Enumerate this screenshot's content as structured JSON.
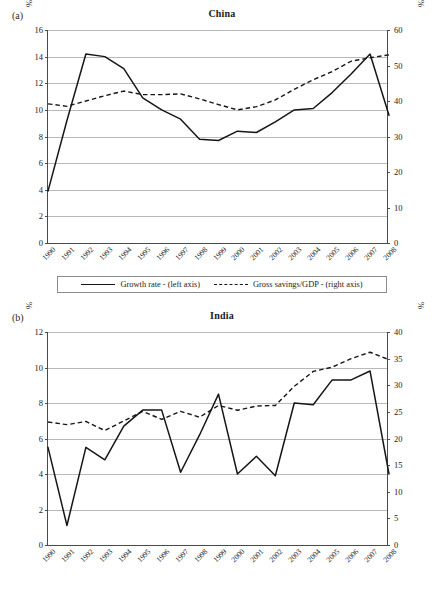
{
  "figure": {
    "caption": ""
  },
  "panels": [
    {
      "label": "(a)",
      "title": "China",
      "y_axis_label": "%",
      "y2_axis_label": "%",
      "left_ticks": [
        "0",
        "2",
        "4",
        "6",
        "8",
        "10",
        "12",
        "14",
        "16"
      ],
      "right_ticks": [
        "0",
        "10",
        "20",
        "30",
        "40",
        "50",
        "60"
      ],
      "legend": [
        {
          "marker": "solid",
          "label": "Growth rate - (left axis)"
        },
        {
          "marker": "dashed",
          "label": "Gross savings/GDP - (right axis)"
        }
      ]
    },
    {
      "label": "(b)",
      "title": "India",
      "y_axis_label": "%",
      "y2_axis_label": "%",
      "left_ticks": [
        "0",
        "2",
        "4",
        "6",
        "8",
        "10",
        "12"
      ],
      "right_ticks": [
        "0",
        "5",
        "10",
        "15",
        "20",
        "25",
        "30",
        "35",
        "40"
      ],
      "legend": [
        {
          "marker": "solid",
          "label": "Growth rate - (left axis)"
        },
        {
          "marker": "dashed",
          "label": "Gross savings/GDP - (right axis)"
        }
      ]
    }
  ],
  "chart_data": [
    {
      "type": "line",
      "title": "China",
      "panel_label": "(a)",
      "xlabel": "",
      "ylabel": "%",
      "y2label": "%",
      "grid": true,
      "legend_position": "bottom",
      "categories": [
        "1990",
        "1991",
        "1992",
        "1993",
        "1994",
        "1995",
        "1996",
        "1997",
        "1998",
        "1999",
        "2000",
        "2001",
        "2002",
        "2003",
        "2004",
        "2005",
        "2006",
        "2007",
        "2008"
      ],
      "ylim": [
        0,
        16
      ],
      "yticks": [
        0,
        2,
        4,
        6,
        8,
        10,
        12,
        14,
        16
      ],
      "y2lim": [
        0,
        60
      ],
      "y2ticks": [
        0,
        10,
        20,
        30,
        40,
        50,
        60
      ],
      "series": [
        {
          "name": "Growth rate - (left axis)",
          "axis": "left",
          "style": "solid",
          "values": [
            3.9,
            9.2,
            14.2,
            14.0,
            13.1,
            10.9,
            10.0,
            9.3,
            7.8,
            7.7,
            8.4,
            8.3,
            9.1,
            10.0,
            10.1,
            11.3,
            12.7,
            14.2,
            9.6
          ]
        },
        {
          "name": "Gross savings/GDP - (right axis)",
          "axis": "right",
          "style": "dashed",
          "values": [
            39.2,
            38.5,
            40.0,
            41.5,
            42.8,
            41.8,
            41.8,
            42.0,
            40.6,
            39.0,
            37.5,
            38.4,
            40.3,
            43.3,
            46.0,
            48.3,
            51.2,
            52.2,
            53.0
          ]
        }
      ]
    },
    {
      "type": "line",
      "title": "India",
      "panel_label": "(b)",
      "xlabel": "",
      "ylabel": "%",
      "y2label": "%",
      "grid": true,
      "legend_position": "bottom",
      "categories": [
        "1990",
        "1991",
        "1992",
        "1993",
        "1994",
        "1995",
        "1996",
        "1997",
        "1998",
        "1999",
        "2000",
        "2001",
        "2002",
        "2003",
        "2004",
        "2005",
        "2006",
        "2007",
        "2008"
      ],
      "ylim": [
        0,
        12
      ],
      "yticks": [
        0,
        2,
        4,
        6,
        8,
        10,
        12
      ],
      "y2lim": [
        0,
        40
      ],
      "y2ticks": [
        0,
        5,
        10,
        15,
        20,
        25,
        30,
        35,
        40
      ],
      "series": [
        {
          "name": "Growth rate - (left axis)",
          "axis": "left",
          "style": "solid",
          "values": [
            5.5,
            1.1,
            5.5,
            4.8,
            6.7,
            7.6,
            7.6,
            4.1,
            6.2,
            8.5,
            4.0,
            5.0,
            3.9,
            8.0,
            7.9,
            9.3,
            9.3,
            9.8,
            4.0
          ]
        },
        {
          "name": "Gross savings/GDP - (right axis)",
          "axis": "right",
          "style": "dashed",
          "values": [
            23.1,
            22.6,
            23.2,
            21.5,
            23.3,
            25.1,
            23.6,
            25.1,
            24.0,
            26.2,
            25.3,
            26.1,
            26.2,
            29.8,
            32.6,
            33.4,
            35.0,
            36.2,
            34.8
          ]
        }
      ]
    }
  ]
}
